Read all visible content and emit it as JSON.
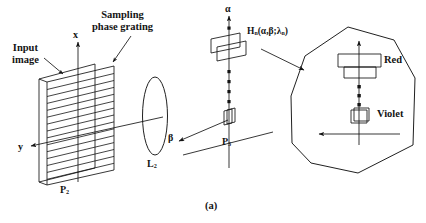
{
  "figure": {
    "caption": "(a)",
    "domain": "optical system schematic",
    "background_color": "#ffffff",
    "line_color": "#141414"
  },
  "labels": {
    "input_image_line1": "Input",
    "input_image_line2": "image",
    "sampling_grating_line1": "Sampling",
    "sampling_grating_line2": "phase grating",
    "axis_x": "x",
    "axis_y": "y",
    "axis_alpha": "α",
    "axis_beta": "β",
    "plane_p2_base": "P",
    "plane_p2_sub": "2",
    "plane_p3_base": "P",
    "plane_p3_sub": "3",
    "lens_l2_base": "L",
    "lens_l2_sub": "2",
    "transfer_fn": {
      "symbol": "H",
      "symbol_sub": "n",
      "open": "(",
      "arg1": "α",
      "comma": ",",
      "arg2": "β",
      "semicolon": ";",
      "arg3": "λ",
      "arg3_sub": "n",
      "close": ")",
      "full_text": "Hₙ(α,β;λₙ)"
    },
    "spectrum_red": "Red",
    "spectrum_violet": "Violet",
    "ellipsis_glyph": "•"
  },
  "elements": {
    "p2_plane": {
      "name": "input image plane with sampling phase grating",
      "grating_line_count": 14
    },
    "lens": {
      "name": "L2 cylindrical lens",
      "shape": "tall ellipse"
    },
    "p3_plane": {
      "name": "spectrum plane P3"
    },
    "callout_polygon": {
      "name": "magnified spectrum detail",
      "sides": 9
    },
    "diffraction_orders_p3": 2,
    "diffraction_orders_callout": 2
  }
}
